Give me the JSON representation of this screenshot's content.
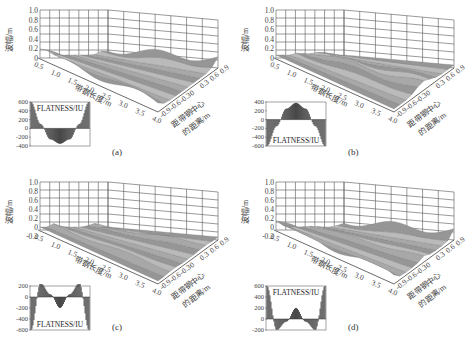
{
  "figure": {
    "panels": [
      {
        "id": "a",
        "caption": "(a)",
        "z_axis_label": "波幅/m",
        "z_ticks": [
          "1.0",
          "0.8",
          "0.6",
          "0.4",
          "0.2",
          "0"
        ],
        "x_axis_label": "带钢长度/m",
        "x_ticks": [
          "0.5",
          "1.0",
          "1.5",
          "2.0",
          "2.5",
          "3.0",
          "3.5",
          "4.0"
        ],
        "y_axis_label": "距带钢中心的距离/m",
        "y_ticks": [
          "-0.9",
          "-0.6",
          "-0.3",
          "0",
          "0.3",
          "0.6",
          "0.9"
        ],
        "inset": {
          "label": "FLATNESS/IU",
          "y_ticks": [
            "600",
            "400",
            "200",
            "0",
            "-200",
            "-400"
          ],
          "label_position": "top"
        }
      },
      {
        "id": "b",
        "caption": "(b)",
        "z_axis_label": "波幅/m",
        "z_ticks": [
          "1.0",
          "0.8",
          "0.6",
          "0.4",
          "0.2",
          "0"
        ],
        "x_axis_label": "带钢长度/m",
        "x_ticks": [
          "0.5",
          "1.0",
          "1.5",
          "2.0",
          "2.5",
          "3.0",
          "3.5",
          "4.0"
        ],
        "y_axis_label": "距带钢中心的距离/m",
        "y_ticks": [
          "-0.9",
          "-0.6",
          "-0.3",
          "0",
          "0.3",
          "0.6",
          "0.9"
        ],
        "inset": {
          "label": "FLATNESS/IU",
          "y_ticks": [
            "400",
            "200",
            "0",
            "-200",
            "-400",
            "-600"
          ],
          "label_position": "bottom"
        }
      },
      {
        "id": "c",
        "caption": "(c)",
        "z_axis_label": "波幅/m",
        "z_ticks": [
          "1.0",
          "0.8",
          "0.6",
          "0.4",
          "0.2",
          "0",
          "-0.2"
        ],
        "x_axis_label": "带钢长度/m",
        "x_ticks": [
          "0.5",
          "1.0",
          "1.5",
          "2.0",
          "2.5",
          "3.0",
          "3.5",
          "4.0"
        ],
        "y_axis_label": "距带钢中心的距离/m",
        "y_ticks": [
          "-0.9",
          "-0.6",
          "-0.3",
          "0",
          "0.3",
          "0.6",
          "0.9"
        ],
        "inset": {
          "label": "FLATNESS/IU",
          "y_ticks": [
            "200",
            "0",
            "-200",
            "-400",
            "-600"
          ],
          "label_position": "bottom"
        }
      },
      {
        "id": "d",
        "caption": "(d)",
        "z_axis_label": "波幅/m",
        "z_ticks": [
          "1.0",
          "0.8",
          "0.6",
          "0.4",
          "0.2",
          "0",
          "-0.2"
        ],
        "x_axis_label": "带钢长度/m",
        "x_ticks": [
          "0.5",
          "1.0",
          "1.5",
          "2.0",
          "2.5",
          "3.0",
          "3.5",
          "4.0"
        ],
        "y_axis_label": "距带钢中心的距离/m",
        "y_ticks": [
          "-0.9",
          "-0.6",
          "-0.3",
          "0",
          "0.3",
          "0.6",
          "0.9"
        ],
        "inset": {
          "label": "FLATNESS/IU",
          "y_ticks": [
            "600",
            "400",
            "200",
            "0",
            "-200"
          ],
          "label_position": "top"
        }
      }
    ]
  },
  "chart_data": [
    {
      "type": "surface",
      "title": "(a)",
      "xlabel": "带钢长度/m",
      "ylabel": "距带钢中心的距离/m",
      "zlabel": "波幅/m",
      "xlim": [
        0.5,
        4.0
      ],
      "ylim": [
        -0.9,
        0.9
      ],
      "zlim": [
        0,
        1.0
      ],
      "description": "Edge waves: amplitude rises at both strip edges",
      "inset": {
        "type": "bar",
        "label": "FLATNESS/IU",
        "ylim": [
          -400,
          600
        ],
        "x": [
          -0.9,
          -0.6,
          -0.3,
          0,
          0.3,
          0.6,
          0.9
        ],
        "values": [
          600,
          100,
          -250,
          -350,
          -250,
          100,
          600
        ]
      }
    },
    {
      "type": "surface",
      "title": "(b)",
      "xlabel": "带钢长度/m",
      "ylabel": "距带钢中心的距离/m",
      "zlabel": "波幅/m",
      "xlim": [
        0.5,
        4.0
      ],
      "ylim": [
        -0.9,
        0.9
      ],
      "zlim": [
        0,
        1.0
      ],
      "description": "Center buckle: amplitude concentrated at strip center",
      "inset": {
        "type": "bar",
        "label": "FLATNESS/IU",
        "ylim": [
          -600,
          400
        ],
        "x": [
          -0.9,
          -0.6,
          -0.3,
          0,
          0.3,
          0.6,
          0.9
        ],
        "values": [
          -600,
          -150,
          250,
          380,
          250,
          -150,
          -600
        ]
      }
    },
    {
      "type": "surface",
      "title": "(c)",
      "xlabel": "带钢长度/m",
      "ylabel": "距带钢中心的距离/m",
      "zlabel": "波幅/m",
      "xlim": [
        0.5,
        4.0
      ],
      "ylim": [
        -0.9,
        0.9
      ],
      "zlim": [
        -0.2,
        1.0
      ],
      "description": "Quarter buckle: amplitude peaks at quarter widths",
      "inset": {
        "type": "bar",
        "label": "FLATNESS/IU",
        "ylim": [
          -600,
          200
        ],
        "x": [
          -0.9,
          -0.6,
          -0.3,
          0,
          0.3,
          0.6,
          0.9
        ],
        "values": [
          -600,
          250,
          50,
          -200,
          50,
          250,
          -600
        ]
      }
    },
    {
      "type": "surface",
      "title": "(d)",
      "xlabel": "带钢长度/m",
      "ylabel": "距带钢中心的距离/m",
      "zlabel": "波幅/m",
      "xlim": [
        0.5,
        4.0
      ],
      "ylim": [
        -0.9,
        0.9
      ],
      "zlim": [
        -0.2,
        1.0
      ],
      "description": "Compound waves: edge and center waves combined",
      "inset": {
        "type": "bar",
        "label": "FLATNESS/IU",
        "ylim": [
          -200,
          600
        ],
        "x": [
          -0.9,
          -0.6,
          -0.3,
          0,
          0.3,
          0.6,
          0.9
        ],
        "values": [
          600,
          -200,
          -50,
          200,
          -50,
          -200,
          600
        ]
      }
    }
  ]
}
